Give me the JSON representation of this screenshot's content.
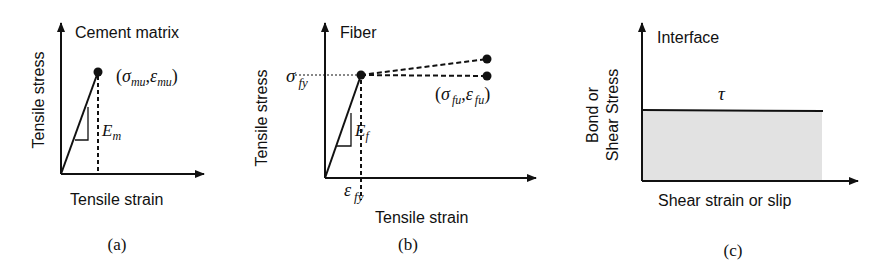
{
  "panels": {
    "a": {
      "caption": "(a)",
      "title": "Cement matrix",
      "ylabel": "Tensile stress",
      "xlabel": "Tensile strain",
      "point_label": {
        "open": "(",
        "sigma": "σ",
        "sigma_sub": "mu",
        "comma": ",",
        "eps": "ε",
        "eps_sub": "mu",
        "close": ")"
      },
      "modulus": {
        "symbol": "E",
        "sub": "m"
      }
    },
    "b": {
      "caption": "(b)",
      "title": "Fiber",
      "ylabel": "Tensile stress",
      "xlabel": "Tensile strain",
      "yield_stress": {
        "symbol": "σ",
        "sub": "fy"
      },
      "yield_strain": {
        "symbol": "ε",
        "sub": "fy"
      },
      "point_label": {
        "open": "(",
        "sigma": "σ",
        "sigma_sub": "fu",
        "comma": ",",
        "eps": "ε",
        "eps_sub": "fu",
        "close": ")"
      },
      "modulus": {
        "symbol": "E",
        "sub": "f"
      }
    },
    "c": {
      "caption": "(c)",
      "title": "Interface",
      "ylabel_line1": "Bond or",
      "ylabel_line2": "Shear Stress",
      "xlabel": "Shear strain or slip",
      "tau": "τ",
      "fill_color": "#e2e2e2"
    }
  },
  "colors": {
    "ink": "#111111",
    "background": "#ffffff",
    "fill": "#e2e2e2"
  }
}
